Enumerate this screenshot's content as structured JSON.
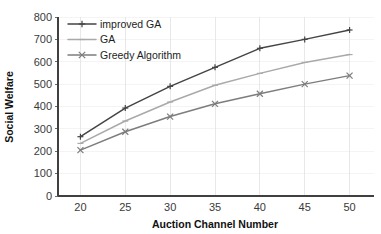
{
  "chart_data": {
    "type": "line",
    "title": "",
    "xlabel": "Auction Channel Number",
    "ylabel": "Social Welfare",
    "x": [
      20,
      25,
      30,
      35,
      40,
      45,
      50
    ],
    "xtick_labels": [
      "20",
      "25",
      "30",
      "35",
      "40",
      "45",
      "50"
    ],
    "ytick_labels": [
      "0",
      "100",
      "200",
      "300",
      "400",
      "500",
      "600",
      "700",
      "800"
    ],
    "yticks": [
      0,
      100,
      200,
      300,
      400,
      500,
      600,
      700,
      800
    ],
    "xlim": [
      17.5,
      52.5
    ],
    "ylim": [
      0,
      800
    ],
    "grid": "faint",
    "legend_position": "top-left",
    "series": [
      {
        "name": "improved GA",
        "values": [
          265,
          393,
          490,
          575,
          660,
          700,
          742
        ],
        "color": "#444444",
        "marker": "plus"
      },
      {
        "name": "GA",
        "values": [
          235,
          335,
          420,
          495,
          548,
          597,
          632
        ],
        "color": "#a9a9a9",
        "marker": "dash"
      },
      {
        "name": "Greedy Algorithm",
        "values": [
          205,
          287,
          355,
          412,
          457,
          500,
          538
        ],
        "color": "#7d7d7d",
        "marker": "x"
      }
    ]
  },
  "axes": {
    "x_title": "Auction Channel Number",
    "y_title": "Social Welfare"
  },
  "legend": {
    "items": [
      {
        "label": "improved GA"
      },
      {
        "label": "GA"
      },
      {
        "label": "Greedy Algorithm"
      }
    ]
  }
}
